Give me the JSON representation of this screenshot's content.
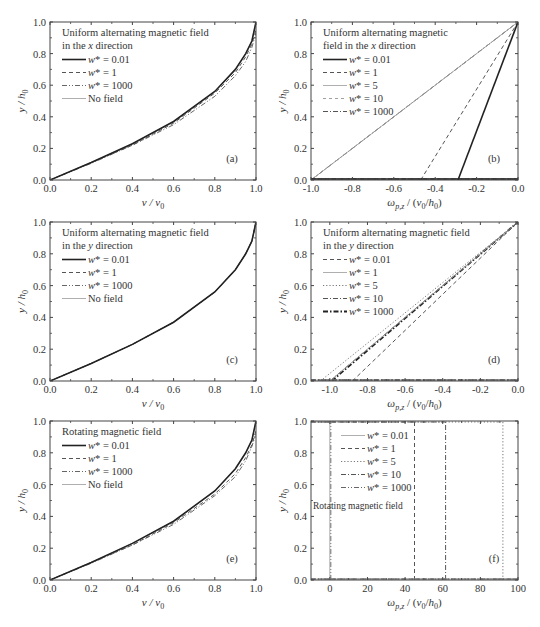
{
  "figure": {
    "width": 540,
    "height": 627
  },
  "chart_data": [
    {
      "id": "a",
      "panel_label": "(a)",
      "type": "line",
      "legend_title": [
        "Uniform alternating magnetic field",
        "in the x direction"
      ],
      "xlabel": "v / v0",
      "ylabel": "y / h0",
      "xlim": [
        0.0,
        1.0
      ],
      "ylim": [
        0.0,
        1.0
      ],
      "xticks": [
        "0.0",
        "0.2",
        "0.4",
        "0.6",
        "0.8",
        "1.0"
      ],
      "yticks": [
        "0.0",
        "0.2",
        "0.4",
        "0.6",
        "0.8",
        "1.0"
      ],
      "grid": false,
      "legend_position": "upper left",
      "series": [
        {
          "name": "w* = 0.01",
          "style": "solid-thick",
          "x": [
            0,
            0.2,
            0.4,
            0.6,
            0.8,
            0.9,
            0.95,
            0.98,
            1.0
          ],
          "y": [
            0,
            0.11,
            0.23,
            0.37,
            0.56,
            0.7,
            0.8,
            0.88,
            1.0
          ]
        },
        {
          "name": "w* = 1",
          "style": "dashed",
          "x": [
            0,
            0.2,
            0.4,
            0.6,
            0.8,
            0.9,
            0.95,
            0.98,
            1.0
          ],
          "y": [
            0,
            0.11,
            0.22,
            0.36,
            0.55,
            0.68,
            0.78,
            0.86,
            0.95
          ]
        },
        {
          "name": "w* = 1000",
          "style": "dash-dot-dot",
          "x": [
            0,
            0.2,
            0.4,
            0.6,
            0.8,
            0.9,
            0.95,
            0.98,
            1.0
          ],
          "y": [
            0,
            0.105,
            0.22,
            0.35,
            0.53,
            0.66,
            0.75,
            0.84,
            0.93
          ]
        },
        {
          "name": "No field",
          "style": "solid-thin",
          "x": [
            0,
            0.2,
            0.4,
            0.6,
            0.8,
            0.9,
            0.95,
            0.98,
            1.0
          ],
          "y": [
            0,
            0.11,
            0.23,
            0.37,
            0.56,
            0.7,
            0.8,
            0.88,
            1.0
          ]
        }
      ]
    },
    {
      "id": "b",
      "panel_label": "(b)",
      "type": "line",
      "legend_title": [
        "Uniform alternating magnetic",
        "field in the x direction"
      ],
      "xlabel": "ωp,z / (v0/h0)",
      "ylabel": "y / h0",
      "xlim": [
        -1.0,
        0.0
      ],
      "ylim": [
        0.0,
        1.0
      ],
      "xticks": [
        "-1.0",
        "-0.8",
        "-0.6",
        "-0.4",
        "-0.2",
        "0.0"
      ],
      "yticks": [
        "0.0",
        "0.2",
        "0.4",
        "0.6",
        "0.8",
        "1.0"
      ],
      "grid": false,
      "legend_position": "upper left",
      "series": [
        {
          "name": "w* = 0.01",
          "style": "solid-thick",
          "x": [
            -0.29,
            0.0
          ],
          "y": [
            0.0,
            1.0
          ]
        },
        {
          "name": "w* = 1",
          "style": "dashed",
          "x": [
            -0.47,
            0.0
          ],
          "y": [
            0.0,
            1.0
          ]
        },
        {
          "name": "w* = 5",
          "style": "solid-thin",
          "x": [
            -1.0,
            0.0
          ],
          "y": [
            0.0,
            1.0
          ]
        },
        {
          "name": "w* = 10",
          "style": "dashed-thin",
          "x": [
            -1.0,
            0.0
          ],
          "y": [
            0.0,
            1.0
          ]
        },
        {
          "name": "w* = 1000",
          "style": "dash-dot",
          "x": [
            -1.0,
            0.0
          ],
          "y": [
            0.0,
            1.0
          ]
        }
      ]
    },
    {
      "id": "c",
      "panel_label": "(c)",
      "type": "line",
      "legend_title": [
        "Uniform alternating magnetic field",
        "in the y direction"
      ],
      "xlabel": "v / v0",
      "ylabel": "y / h0",
      "xlim": [
        0.0,
        1.0
      ],
      "ylim": [
        0.0,
        1.0
      ],
      "xticks": [
        "0.0",
        "0.2",
        "0.4",
        "0.6",
        "0.8",
        "1.0"
      ],
      "yticks": [
        "0.0",
        "0.2",
        "0.4",
        "0.6",
        "0.8",
        "1.0"
      ],
      "grid": false,
      "legend_position": "upper left",
      "series": [
        {
          "name": "w* = 0.01",
          "style": "solid-thick",
          "x": [
            0,
            0.2,
            0.4,
            0.6,
            0.8,
            0.9,
            0.95,
            0.98,
            1.0
          ],
          "y": [
            0,
            0.11,
            0.23,
            0.37,
            0.56,
            0.7,
            0.8,
            0.88,
            1.0
          ]
        },
        {
          "name": "w* = 1",
          "style": "dashed",
          "x": [
            0,
            0.2,
            0.4,
            0.6,
            0.8,
            0.9,
            0.95,
            0.98,
            1.0
          ],
          "y": [
            0,
            0.11,
            0.23,
            0.37,
            0.56,
            0.7,
            0.8,
            0.88,
            1.0
          ]
        },
        {
          "name": "w* = 1000",
          "style": "dash-dot-dot",
          "x": [
            0,
            0.2,
            0.4,
            0.6,
            0.8,
            0.9,
            0.95,
            0.98,
            1.0
          ],
          "y": [
            0,
            0.11,
            0.23,
            0.37,
            0.56,
            0.7,
            0.8,
            0.88,
            1.0
          ]
        },
        {
          "name": "No field",
          "style": "solid-thin",
          "x": [
            0,
            0.2,
            0.4,
            0.6,
            0.8,
            0.9,
            0.95,
            0.98,
            1.0
          ],
          "y": [
            0,
            0.11,
            0.23,
            0.37,
            0.56,
            0.7,
            0.8,
            0.88,
            1.0
          ]
        }
      ]
    },
    {
      "id": "d",
      "panel_label": "(d)",
      "type": "line",
      "legend_title": [
        "Uniform alternating magnetic field",
        "in the y direction"
      ],
      "xlabel": "ωp,z / (v0/h0)",
      "ylabel": "y / h0",
      "xlim": [
        -1.1,
        0.0
      ],
      "ylim": [
        0.0,
        1.0
      ],
      "xticks": [
        "-1.0",
        "-0.8",
        "-0.6",
        "-0.4",
        "-0.2",
        "0.0"
      ],
      "yticks": [
        "0.0",
        "0.2",
        "0.4",
        "0.6",
        "0.8",
        "1.0"
      ],
      "grid": false,
      "legend_position": "upper left",
      "series": [
        {
          "name": "w* = 0.01",
          "style": "dashed",
          "x": [
            -0.88,
            0.0
          ],
          "y": [
            0.0,
            1.0
          ]
        },
        {
          "name": "w* = 1",
          "style": "solid-thin",
          "x": [
            -1.0,
            0.0
          ],
          "y": [
            0.0,
            1.0
          ]
        },
        {
          "name": "w* = 5",
          "style": "dotted",
          "x": [
            -1.05,
            0.0
          ],
          "y": [
            0.0,
            1.0
          ]
        },
        {
          "name": "w* = 10",
          "style": "dash-dot",
          "x": [
            -1.0,
            0.0
          ],
          "y": [
            0.0,
            1.0
          ]
        },
        {
          "name": "w* = 1000",
          "style": "dash-dot-thick",
          "x": [
            -0.99,
            0.0
          ],
          "y": [
            0.0,
            1.0
          ]
        }
      ]
    },
    {
      "id": "e",
      "panel_label": "(e)",
      "type": "line",
      "legend_title": [
        "Rotating magnetic field"
      ],
      "xlabel": "v / v0",
      "ylabel": "y / h0",
      "xlim": [
        0.0,
        1.0
      ],
      "ylim": [
        0.0,
        1.0
      ],
      "xticks": [
        "0.0",
        "0.2",
        "0.4",
        "0.6",
        "0.8",
        "1.0"
      ],
      "yticks": [
        "0.0",
        "0.2",
        "0.4",
        "0.6",
        "0.8",
        "1.0"
      ],
      "grid": false,
      "legend_position": "upper left",
      "series": [
        {
          "name": "w* = 0.01",
          "style": "solid-thick",
          "x": [
            0,
            0.2,
            0.4,
            0.6,
            0.8,
            0.9,
            0.95,
            0.98,
            1.0
          ],
          "y": [
            0,
            0.11,
            0.23,
            0.37,
            0.56,
            0.7,
            0.8,
            0.88,
            1.0
          ]
        },
        {
          "name": "w* = 1",
          "style": "dashed",
          "x": [
            0,
            0.2,
            0.4,
            0.6,
            0.8,
            0.9,
            0.95,
            0.98,
            1.0
          ],
          "y": [
            0,
            0.11,
            0.22,
            0.36,
            0.54,
            0.67,
            0.77,
            0.85,
            0.94
          ]
        },
        {
          "name": "w* = 1000",
          "style": "dash-dot-dot",
          "x": [
            0,
            0.2,
            0.4,
            0.6,
            0.8,
            0.9,
            0.95,
            0.98,
            1.0
          ],
          "y": [
            0,
            0.105,
            0.22,
            0.35,
            0.53,
            0.65,
            0.75,
            0.84,
            0.92
          ]
        },
        {
          "name": "No field",
          "style": "solid-thin",
          "x": [
            0,
            0.2,
            0.4,
            0.6,
            0.8,
            0.9,
            0.95,
            0.98,
            1.0
          ],
          "y": [
            0,
            0.11,
            0.23,
            0.37,
            0.56,
            0.7,
            0.8,
            0.88,
            1.0
          ]
        }
      ]
    },
    {
      "id": "f",
      "panel_label": "(f)",
      "type": "line",
      "legend_title": [
        "Rotating magnetic field"
      ],
      "xlabel": "ωp,z / (v0/h0)",
      "ylabel": "y / h0",
      "xlim": [
        -10,
        100
      ],
      "ylim": [
        0.0,
        1.0
      ],
      "xticks": [
        "0",
        "20",
        "40",
        "60",
        "80",
        "100"
      ],
      "yticks": [
        "0.0",
        "0.2",
        "0.4",
        "0.6",
        "0.8",
        "1.0"
      ],
      "grid": false,
      "legend_position": "upper left",
      "series": [
        {
          "name": "w* = 0.01",
          "style": "solid-thin",
          "x": [
            0.0,
            0.0
          ],
          "y": [
            0.0,
            1.0
          ]
        },
        {
          "name": "w* = 1",
          "style": "dashed",
          "x": [
            45.0,
            45.0
          ],
          "y": [
            0.0,
            1.0
          ]
        },
        {
          "name": "w* = 5",
          "style": "dotted",
          "x": [
            92.0,
            92.0
          ],
          "y": [
            0.0,
            1.0
          ]
        },
        {
          "name": "w* = 10",
          "style": "dash-dot",
          "x": [
            61.5,
            61.5
          ],
          "y": [
            0.0,
            1.0
          ]
        },
        {
          "name": "w* = 1000",
          "style": "dash-dot-dot",
          "x": [
            0.5,
            0.5
          ],
          "y": [
            0.0,
            1.0
          ]
        }
      ]
    }
  ]
}
